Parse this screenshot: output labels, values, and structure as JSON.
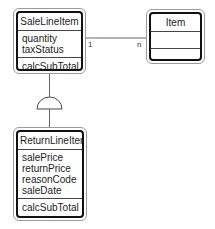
{
  "classes": {
    "sale_line_item": {
      "name": "SaleLineItem",
      "attributes": [
        "quantity",
        "taxStatus"
      ],
      "operations": [
        "calcSubTotal"
      ]
    },
    "item": {
      "name": "Item",
      "attributes": [],
      "operations": []
    },
    "return_line_item": {
      "name": "ReturnLineItem",
      "attributes": [
        "salePrice",
        "returnPrice",
        "reasonCode",
        "saleDate"
      ],
      "operations": [
        "calcSubTotal"
      ]
    }
  },
  "associations": [
    {
      "from": "SaleLineItem",
      "to": "Item",
      "from_multiplicity": "1",
      "to_multiplicity": "n"
    }
  ],
  "generalizations": [
    {
      "parent": "SaleLineItem",
      "child": "ReturnLineItem"
    }
  ]
}
